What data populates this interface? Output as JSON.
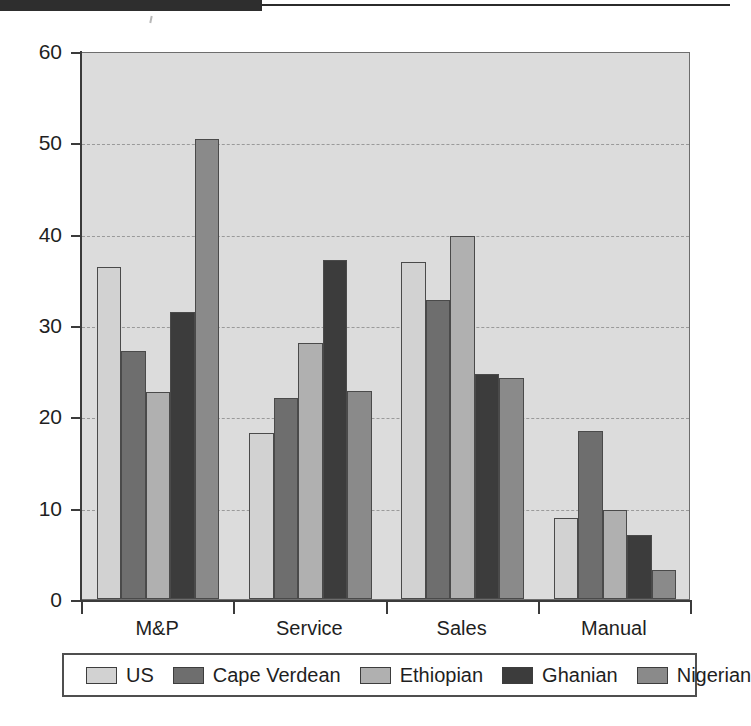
{
  "scan_artifact": {
    "present": true,
    "description": "dark-scan-band"
  },
  "legend": {
    "position": "bottom",
    "items": [
      {
        "label": "US",
        "color": "#d2d2d2"
      },
      {
        "label": "Cape Verdean",
        "color": "#6e6e6e"
      },
      {
        "label": "Ethiopian",
        "color": "#b0b0b0"
      },
      {
        "label": "Ghanian",
        "color": "#3c3c3c"
      },
      {
        "label": "Nigerian",
        "color": "#8a8a8a"
      }
    ]
  },
  "chart_data": {
    "type": "bar",
    "title": "",
    "xlabel": "",
    "ylabel": "",
    "ylim": [
      0,
      60
    ],
    "yticks": [
      0,
      10,
      20,
      30,
      40,
      50,
      60
    ],
    "grid": true,
    "legend_position": "bottom",
    "categories": [
      "M&P",
      "Service",
      "Sales",
      "Manual"
    ],
    "series": [
      {
        "name": "US",
        "color": "#d2d2d2",
        "values": [
          36.3,
          18.2,
          36.9,
          8.9
        ]
      },
      {
        "name": "Cape Verdean",
        "color": "#6e6e6e",
        "values": [
          27.2,
          22.0,
          32.7,
          18.4
        ]
      },
      {
        "name": "Ethiopian",
        "color": "#b0b0b0",
        "values": [
          22.7,
          28.0,
          39.7,
          9.8
        ]
      },
      {
        "name": "Ghanian",
        "color": "#3c3c3c",
        "values": [
          31.4,
          37.1,
          24.6,
          7.0
        ]
      },
      {
        "name": "Nigerian",
        "color": "#8a8a8a",
        "values": [
          50.4,
          22.8,
          24.2,
          3.2
        ]
      }
    ]
  },
  "style": {
    "plot_background": "#dcdcdc",
    "axis_color": "#3b3b3b",
    "gridline_color": "#9a9a9a",
    "page_background": "#ffffff"
  }
}
